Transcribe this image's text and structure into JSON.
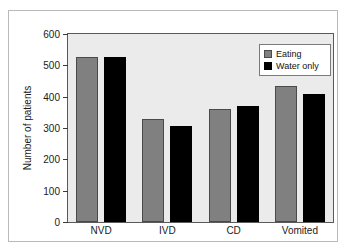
{
  "chart_data": {
    "type": "bar",
    "title": "",
    "subtitle": "",
    "xlabel": "",
    "ylabel": "Number of patients",
    "categories": [
      "NVD",
      "IVD",
      "CD",
      "Vomited"
    ],
    "ylim": [
      0,
      600
    ],
    "y_ticks": [
      0,
      100,
      200,
      300,
      400,
      500,
      600
    ],
    "grid": false,
    "legend_position": "top-right",
    "series": [
      {
        "name": "Eating",
        "color": "#808080",
        "values": [
          527,
          330,
          360,
          433
        ]
      },
      {
        "name": "Water only",
        "color": "#000000",
        "values": [
          527,
          308,
          370,
          410
        ]
      }
    ],
    "annotations": []
  },
  "legend": {
    "entries": [
      {
        "label": "Eating",
        "swatch": "gray-square-swatch"
      },
      {
        "label": "Water only",
        "swatch": "black-square-swatch"
      }
    ]
  },
  "colors": {
    "eating": "#808080",
    "water_only": "#000000",
    "plot_background": "#ebebeb",
    "figure_background": "#ffffff",
    "axis": "#5a5a5a",
    "frame_border": "#b9b9b9"
  }
}
